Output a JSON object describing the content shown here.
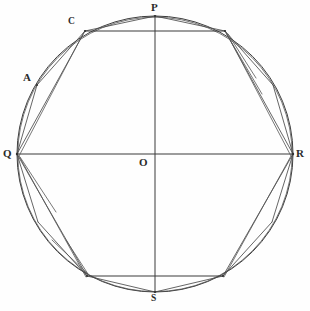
{
  "figure": {
    "background_color": "#fefefe",
    "line_color": "#3a3a3a",
    "width": 310,
    "height": 311
  },
  "circle": {
    "center": {
      "x": 155,
      "y": 154
    },
    "radius": 138,
    "label": "circumscribed-circle"
  },
  "labels": [
    {
      "id": "P",
      "text": "P",
      "x": 151,
      "y": 2,
      "anchor": "top-center"
    },
    {
      "id": "C",
      "text": "C",
      "x": 68,
      "y": 17,
      "anchor": "left"
    },
    {
      "id": "A",
      "text": "A",
      "x": 23,
      "y": 72,
      "anchor": "left"
    },
    {
      "id": "Q",
      "text": "Q",
      "x": 3,
      "y": 148,
      "anchor": "left"
    },
    {
      "id": "O",
      "text": "O",
      "x": 139,
      "y": 157,
      "anchor": "center"
    },
    {
      "id": "R",
      "text": "R",
      "x": 296,
      "y": 148,
      "anchor": "right"
    },
    {
      "id": "S",
      "text": "S",
      "x": 151,
      "y": 294,
      "anchor": "bottom-center"
    }
  ],
  "points": {
    "P": {
      "x": 155,
      "y": 16
    },
    "S": {
      "x": 155,
      "y": 292
    },
    "Q": {
      "x": 17,
      "y": 154
    },
    "R": {
      "x": 293,
      "y": 154
    },
    "O": {
      "x": 155,
      "y": 154
    },
    "C": {
      "x": 85,
      "y": 31
    },
    "C_mirror": {
      "x": 225,
      "y": 31
    },
    "A": {
      "x": 37,
      "y": 85
    },
    "A_mirror": {
      "x": 273,
      "y": 85
    },
    "bottom_left": {
      "x": 87,
      "y": 276
    },
    "bottom_right": {
      "x": 223,
      "y": 276
    },
    "lower_left": {
      "x": 38,
      "y": 222
    },
    "lower_right": {
      "x": 272,
      "y": 222
    }
  },
  "diameters": [
    {
      "name": "vertical-diameter-PS",
      "from": "P",
      "to": "S"
    },
    {
      "name": "horizontal-diameter-QR",
      "from": "Q",
      "to": "R"
    }
  ],
  "chords": [
    {
      "name": "chord-C-to-Cmirror",
      "from": "C",
      "to": "C_mirror"
    },
    {
      "name": "chord-bottomleft-to-bottomright",
      "from": "bottom_left",
      "to": "bottom_right"
    },
    {
      "name": "chord-Q-to-C",
      "from": "Q",
      "to": "C"
    },
    {
      "name": "chord-Q-to-A",
      "from": "Q",
      "to": "A"
    },
    {
      "name": "chord-A-to-C",
      "from": "A",
      "to": "C"
    },
    {
      "name": "chord-C-to-P",
      "from": "C",
      "to": "P"
    },
    {
      "name": "chord-R-to-Cmirror",
      "from": "R",
      "to": "C_mirror"
    },
    {
      "name": "chord-Cmirror-to-P",
      "from": "C_mirror",
      "to": "P"
    },
    {
      "name": "chord-Q-to-bottomleft",
      "from": "Q",
      "to": "bottom_left"
    },
    {
      "name": "chord-bottomleft-to-S",
      "from": "bottom_left",
      "to": "S"
    },
    {
      "name": "chord-R-to-bottomright",
      "from": "R",
      "to": "bottom_right"
    },
    {
      "name": "chord-bottomright-to-S",
      "from": "bottom_right",
      "to": "S"
    }
  ],
  "inscribed_polygon": {
    "name": "inscribed-octagon",
    "vertices": [
      "P",
      "C_mirror",
      "R",
      "bottom_right",
      "S",
      "bottom_left",
      "Q",
      "C"
    ]
  }
}
